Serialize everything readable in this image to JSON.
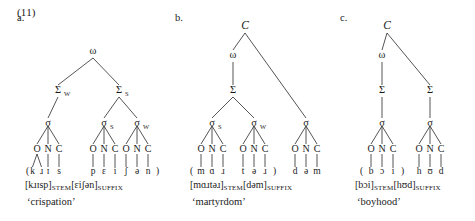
{
  "example_number": "(11)",
  "page": {
    "width": 475,
    "height": 221,
    "background": "#ffffff",
    "ink": "#1a1a1a"
  },
  "panels": [
    {
      "id": "a",
      "letter": "a.",
      "letter_x": 17,
      "letter_y": 21,
      "origin_x": 0,
      "nodes": {
        "omega": {
          "label": "ω",
          "sub": "",
          "x": 93,
          "y": 54
        },
        "foot_left": {
          "label": "Σ",
          "sub": "W",
          "x": 58,
          "y": 93
        },
        "foot_right": {
          "label": "Σ",
          "sub": "S",
          "x": 119,
          "y": 93
        },
        "sigma_1": {
          "label": "σ",
          "sub": "",
          "x": 48,
          "y": 126
        },
        "sigma_2": {
          "label": "σ",
          "sub": "S",
          "x": 104,
          "y": 126
        },
        "sigma_3": {
          "label": "σ",
          "sub": "W",
          "x": 137,
          "y": 126
        }
      },
      "syllables": [
        {
          "x": 48,
          "onset": "O",
          "nucleus": "N",
          "coda": "C",
          "onset_branching": true,
          "segments": [
            "k",
            "ɹ",
            "ɪ",
            "s"
          ],
          "open_paren": true,
          "close_paren": false
        },
        {
          "x": 104,
          "onset": "O",
          "nucleus": "N",
          "coda": "C",
          "onset_branching": false,
          "segments": [
            "p",
            "ɛ",
            "i"
          ],
          "open_paren": false,
          "close_paren": false
        },
        {
          "x": 137,
          "onset": "O",
          "nucleus": "N",
          "coda": "C",
          "onset_branching": false,
          "segments": [
            "ʃ",
            "ə",
            "n"
          ],
          "open_paren": false,
          "close_paren": true
        }
      ],
      "morphology": [
        {
          "text": "[kɹɪsp]",
          "smallcaps": false
        },
        {
          "text": "STEM",
          "smallcaps": true
        },
        {
          "text": "[ɛiʃən]",
          "smallcaps": false
        },
        {
          "text": "SUFFIX",
          "smallcaps": true
        }
      ],
      "morphology_x": 25,
      "morphology_y": 188,
      "gloss": "‘crispation’",
      "gloss_x": 27,
      "gloss_y": 205
    },
    {
      "id": "b",
      "letter": "b.",
      "letter_x": 175,
      "letter_y": 21,
      "origin_x": 0,
      "nodes": {
        "clitic": {
          "label": "C",
          "sub": "",
          "italic": true,
          "x": 245,
          "y": 29
        },
        "omega": {
          "label": "ω",
          "sub": "",
          "x": 233,
          "y": 58
        },
        "foot": {
          "label": "Σ",
          "sub": "",
          "x": 233,
          "y": 93
        },
        "sigma_1": {
          "label": "σ",
          "sub": "S",
          "x": 212,
          "y": 126
        },
        "sigma_2": {
          "label": "σ",
          "sub": "W",
          "x": 254,
          "y": 126
        },
        "sigma_3": {
          "label": "σ",
          "sub": "",
          "x": 306,
          "y": 126
        }
      },
      "syllables": [
        {
          "x": 212,
          "onset": "O",
          "nucleus": "N",
          "coda": "C",
          "onset_branching": false,
          "segments": [
            "m",
            "ɑ",
            "ɹ"
          ],
          "open_paren": true,
          "close_paren": false
        },
        {
          "x": 254,
          "onset": "O",
          "nucleus": "N",
          "coda": "C",
          "onset_branching": false,
          "segments": [
            "t",
            "ə",
            "ɹ"
          ],
          "open_paren": false,
          "close_paren": true
        },
        {
          "x": 306,
          "onset": "O",
          "nucleus": "N",
          "coda": "C",
          "onset_branching": false,
          "segments": [
            "d",
            "ə",
            "m"
          ],
          "open_paren": false,
          "close_paren": false
        }
      ],
      "morphology": [
        {
          "text": "[mɑɹtəɹ]",
          "smallcaps": false
        },
        {
          "text": "STEM",
          "smallcaps": true
        },
        {
          "text": "[dəm]",
          "smallcaps": false
        },
        {
          "text": "SUFFIX",
          "smallcaps": true
        }
      ],
      "morphology_x": 190,
      "morphology_y": 188,
      "gloss": "‘martyrdom’",
      "gloss_x": 192,
      "gloss_y": 205
    },
    {
      "id": "c",
      "letter": "c.",
      "letter_x": 340,
      "letter_y": 21,
      "origin_x": 0,
      "nodes": {
        "clitic": {
          "label": "C",
          "sub": "",
          "italic": true,
          "x": 387,
          "y": 29
        },
        "omega": {
          "label": "ω",
          "sub": "",
          "x": 382,
          "y": 58
        },
        "foot_left": {
          "label": "Σ",
          "sub": "",
          "x": 382,
          "y": 93
        },
        "foot_right": {
          "label": "Σ",
          "sub": "",
          "x": 430,
          "y": 93
        },
        "sigma_1": {
          "label": "σ",
          "sub": "",
          "x": 382,
          "y": 126
        },
        "sigma_2": {
          "label": "σ",
          "sub": "",
          "x": 430,
          "y": 126
        }
      },
      "syllables": [
        {
          "x": 382,
          "onset": "O",
          "nucleus": "N",
          "coda": "C",
          "onset_branching": false,
          "segments": [
            "b",
            "ɔ",
            "i"
          ],
          "open_paren": true,
          "close_paren": true
        },
        {
          "x": 430,
          "onset": "O",
          "nucleus": "N",
          "coda": "C",
          "onset_branching": false,
          "segments": [
            "h",
            "ʊ",
            "d"
          ],
          "open_paren": false,
          "close_paren": false
        }
      ],
      "morphology": [
        {
          "text": "[bɔi]",
          "smallcaps": false
        },
        {
          "text": "STEM",
          "smallcaps": true
        },
        {
          "text": "[hʊd]",
          "smallcaps": false
        },
        {
          "text": "SUFFIX",
          "smallcaps": true
        }
      ],
      "morphology_x": 355,
      "morphology_y": 188,
      "gloss": "‘boyhood’",
      "gloss_x": 357,
      "gloss_y": 205
    }
  ],
  "edges": {
    "a": [
      [
        "omega",
        "foot_left"
      ],
      [
        "omega",
        "foot_right"
      ],
      [
        "foot_left",
        "sigma_1"
      ],
      [
        "foot_right",
        "sigma_2"
      ],
      [
        "foot_right",
        "sigma_3"
      ]
    ],
    "b": [
      [
        "clitic",
        "omega"
      ],
      [
        "clitic",
        "sigma_3"
      ],
      [
        "omega",
        "foot"
      ],
      [
        "foot",
        "sigma_1"
      ],
      [
        "foot",
        "sigma_2"
      ]
    ],
    "c": [
      [
        "clitic",
        "omega"
      ],
      [
        "clitic",
        "foot_right"
      ],
      [
        "omega",
        "foot_left"
      ],
      [
        "foot_left",
        "sigma_1"
      ],
      [
        "foot_right",
        "sigma_2"
      ]
    ]
  },
  "layout": {
    "onc_row_y": 152,
    "seg_row_y": 174,
    "onc_spacing": 11,
    "sigma_to_onc_top": 134
  }
}
